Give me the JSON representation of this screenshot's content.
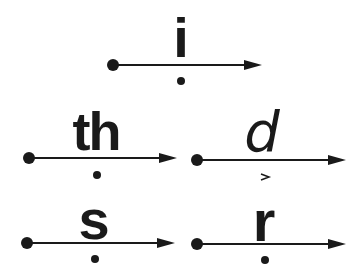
{
  "diagram": {
    "title": "",
    "units": [
      {
        "id": "i",
        "label": "i",
        "style": "bold",
        "start_x": 113,
        "end_x": 262,
        "line_y": 65,
        "label_x": 181,
        "label_top": 16,
        "mark": "dot",
        "mark_x": 181,
        "mark_y": 81
      },
      {
        "id": "th",
        "label": "th",
        "style": "bold",
        "start_x": 29,
        "end_x": 177,
        "line_y": 158,
        "label_x": 95,
        "label_top": 112,
        "mark": "dot",
        "mark_x": 97,
        "mark_y": 175
      },
      {
        "id": "d",
        "label": "d",
        "style": "italic",
        "start_x": 197,
        "end_x": 346,
        "line_y": 160,
        "label_x": 262,
        "label_top": 110,
        "mark": "caret",
        "mark_x": 265,
        "mark_y": 177
      },
      {
        "id": "s",
        "label": "s",
        "style": "bold",
        "start_x": 27,
        "end_x": 175,
        "line_y": 243,
        "label_x": 93,
        "label_top": 203,
        "mark": "dot",
        "mark_x": 95,
        "mark_y": 259
      },
      {
        "id": "r",
        "label": "r",
        "style": "bold",
        "start_x": 197,
        "end_x": 346,
        "line_y": 244,
        "label_x": 264,
        "label_top": 205,
        "mark": "dot",
        "mark_x": 265,
        "mark_y": 260
      }
    ],
    "colors": {
      "ink": "#1a1a1a",
      "background": "#ffffff"
    }
  }
}
